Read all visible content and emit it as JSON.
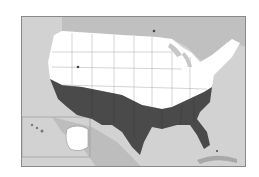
{
  "map": {
    "type": "US climate zone map",
    "regions": [
      {
        "name": "northern-zone",
        "color": "#ffffff"
      },
      {
        "name": "southern-zone",
        "color": "#4a4a4a"
      }
    ],
    "colors": {
      "ocean": "#d2d2d2",
      "land_outside": "#b8b8b8",
      "north": "#ffffff",
      "south": "#4a4a4a",
      "borders": "#9a9a9a"
    }
  }
}
